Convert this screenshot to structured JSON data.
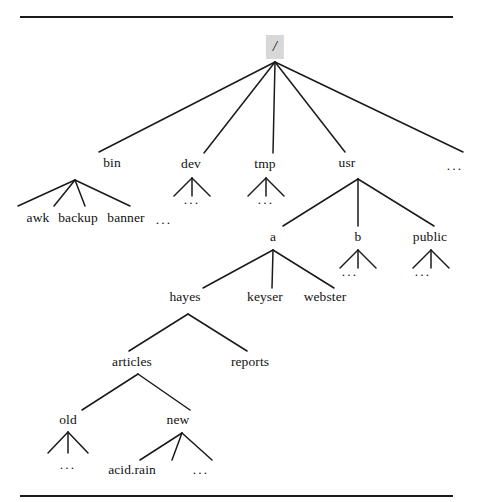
{
  "figure": {
    "kind": "unix-filesystem-tree-diagram",
    "top_rule": {
      "x1": 20,
      "y": 16,
      "x2": 453
    },
    "bottom_rule": {
      "x1": 20,
      "y": 495,
      "x2": 453
    },
    "line_color": "#1a1a1a",
    "text_color": "#111111",
    "root_highlight_color": "#d8d8d8",
    "background_color": "#ffffff"
  },
  "nodes": [
    {
      "id": "root",
      "label": "/",
      "x": 275,
      "y": 47,
      "kind": "root"
    },
    {
      "id": "bin",
      "label": "bin",
      "x": 112,
      "y": 163,
      "kind": "dir"
    },
    {
      "id": "dev",
      "label": "dev",
      "x": 191,
      "y": 164,
      "kind": "dir"
    },
    {
      "id": "tmp",
      "label": "tmp",
      "x": 265,
      "y": 164,
      "kind": "dir"
    },
    {
      "id": "usr",
      "label": "usr",
      "x": 347,
      "y": 163,
      "kind": "dir"
    },
    {
      "id": "root_more",
      "label": "...",
      "x": 455,
      "y": 166,
      "kind": "ellipsis"
    },
    {
      "id": "awk",
      "label": "awk",
      "x": 38,
      "y": 218,
      "kind": "file"
    },
    {
      "id": "backup",
      "label": "backup",
      "x": 78,
      "y": 218,
      "kind": "file"
    },
    {
      "id": "banner",
      "label": "banner",
      "x": 126,
      "y": 218,
      "kind": "file"
    },
    {
      "id": "bin_more",
      "label": "...",
      "x": 164,
      "y": 220,
      "kind": "ellipsis"
    },
    {
      "id": "dev_more",
      "label": "...",
      "x": 192,
      "y": 200,
      "kind": "ellipsis"
    },
    {
      "id": "tmp_more",
      "label": "...",
      "x": 266,
      "y": 200,
      "kind": "ellipsis"
    },
    {
      "id": "a",
      "label": "a",
      "x": 273,
      "y": 237,
      "kind": "dir"
    },
    {
      "id": "b",
      "label": "b",
      "x": 358,
      "y": 237,
      "kind": "dir"
    },
    {
      "id": "public",
      "label": "public",
      "x": 430,
      "y": 237,
      "kind": "dir"
    },
    {
      "id": "b_more",
      "label": "...",
      "x": 350,
      "y": 272,
      "kind": "ellipsis"
    },
    {
      "id": "pub_more",
      "label": "...",
      "x": 423,
      "y": 272,
      "kind": "ellipsis"
    },
    {
      "id": "hayes",
      "label": "hayes",
      "x": 185,
      "y": 297,
      "kind": "dir"
    },
    {
      "id": "keyser",
      "label": "keyser",
      "x": 265,
      "y": 297,
      "kind": "dir"
    },
    {
      "id": "webster",
      "label": "webster",
      "x": 325,
      "y": 297,
      "kind": "dir"
    },
    {
      "id": "articles",
      "label": "articles",
      "x": 132,
      "y": 362,
      "kind": "dir"
    },
    {
      "id": "reports",
      "label": "reports",
      "x": 250,
      "y": 362,
      "kind": "dir"
    },
    {
      "id": "old",
      "label": "old",
      "x": 68,
      "y": 420,
      "kind": "dir"
    },
    {
      "id": "new",
      "label": "new",
      "x": 178,
      "y": 420,
      "kind": "dir"
    },
    {
      "id": "old_more",
      "label": "...",
      "x": 68,
      "y": 465,
      "kind": "ellipsis"
    },
    {
      "id": "acidrain",
      "label": "acid.rain",
      "x": 132,
      "y": 470,
      "kind": "file"
    },
    {
      "id": "new_more",
      "label": "...",
      "x": 201,
      "y": 470,
      "kind": "ellipsis"
    }
  ],
  "edges": [
    {
      "from": "root",
      "to": "bin",
      "x1": 275,
      "y1": 62,
      "x2": 99,
      "y2": 152
    },
    {
      "from": "root",
      "to": "dev",
      "x1": 275,
      "y1": 62,
      "x2": 204,
      "y2": 153
    },
    {
      "from": "root",
      "to": "tmp",
      "x1": 275,
      "y1": 62,
      "x2": 273,
      "y2": 153
    },
    {
      "from": "root",
      "to": "usr",
      "x1": 275,
      "y1": 62,
      "x2": 345,
      "y2": 152
    },
    {
      "from": "root",
      "to": "root_more",
      "x1": 275,
      "y1": 62,
      "x2": 463,
      "y2": 152
    },
    {
      "from": "bin",
      "to": "awk",
      "x1": 75,
      "y1": 180,
      "x2": 18,
      "y2": 206
    },
    {
      "from": "bin",
      "to": "backup",
      "x1": 75,
      "y1": 180,
      "x2": 54,
      "y2": 206
    },
    {
      "from": "bin",
      "to": "banner",
      "x1": 75,
      "y1": 180,
      "x2": 85,
      "y2": 206
    },
    {
      "from": "bin",
      "to": "bin_more",
      "x1": 75,
      "y1": 180,
      "x2": 130,
      "y2": 206
    },
    {
      "from": "dev",
      "to": "dev_c1",
      "x1": 192,
      "y1": 178,
      "x2": 174,
      "y2": 196
    },
    {
      "from": "dev",
      "to": "dev_c2",
      "x1": 192,
      "y1": 178,
      "x2": 192,
      "y2": 196
    },
    {
      "from": "dev",
      "to": "dev_c3",
      "x1": 192,
      "y1": 178,
      "x2": 210,
      "y2": 196
    },
    {
      "from": "tmp",
      "to": "tmp_c1",
      "x1": 266,
      "y1": 178,
      "x2": 248,
      "y2": 196
    },
    {
      "from": "tmp",
      "to": "tmp_c2",
      "x1": 266,
      "y1": 178,
      "x2": 266,
      "y2": 196
    },
    {
      "from": "tmp",
      "to": "tmp_c3",
      "x1": 266,
      "y1": 178,
      "x2": 284,
      "y2": 196
    },
    {
      "from": "usr",
      "to": "a",
      "x1": 358,
      "y1": 179,
      "x2": 283,
      "y2": 226
    },
    {
      "from": "usr",
      "to": "b",
      "x1": 358,
      "y1": 179,
      "x2": 358,
      "y2": 226
    },
    {
      "from": "usr",
      "to": "public",
      "x1": 358,
      "y1": 179,
      "x2": 434,
      "y2": 226
    },
    {
      "from": "b",
      "to": "b_c1",
      "x1": 358,
      "y1": 250,
      "x2": 340,
      "y2": 268
    },
    {
      "from": "b",
      "to": "b_c2",
      "x1": 358,
      "y1": 250,
      "x2": 358,
      "y2": 268
    },
    {
      "from": "b",
      "to": "b_c3",
      "x1": 358,
      "y1": 250,
      "x2": 376,
      "y2": 268
    },
    {
      "from": "public",
      "to": "p_c1",
      "x1": 431,
      "y1": 250,
      "x2": 413,
      "y2": 268
    },
    {
      "from": "public",
      "to": "p_c2",
      "x1": 431,
      "y1": 250,
      "x2": 431,
      "y2": 268
    },
    {
      "from": "public",
      "to": "p_c3",
      "x1": 431,
      "y1": 250,
      "x2": 449,
      "y2": 268
    },
    {
      "from": "a",
      "to": "hayes",
      "x1": 273,
      "y1": 250,
      "x2": 203,
      "y2": 288
    },
    {
      "from": "a",
      "to": "keyser",
      "x1": 273,
      "y1": 250,
      "x2": 272,
      "y2": 288
    },
    {
      "from": "a",
      "to": "webster",
      "x1": 273,
      "y1": 250,
      "x2": 334,
      "y2": 288
    },
    {
      "from": "hayes",
      "to": "articles",
      "x1": 188,
      "y1": 314,
      "x2": 129,
      "y2": 351
    },
    {
      "from": "hayes",
      "to": "reports",
      "x1": 188,
      "y1": 314,
      "x2": 247,
      "y2": 351
    },
    {
      "from": "articles",
      "to": "old",
      "x1": 138,
      "y1": 374,
      "x2": 82,
      "y2": 410
    },
    {
      "from": "articles",
      "to": "new",
      "x1": 138,
      "y1": 374,
      "x2": 190,
      "y2": 410
    },
    {
      "from": "old",
      "to": "old_c1",
      "x1": 68,
      "y1": 432,
      "x2": 48,
      "y2": 453
    },
    {
      "from": "old",
      "to": "old_c2",
      "x1": 68,
      "y1": 432,
      "x2": 68,
      "y2": 453
    },
    {
      "from": "old",
      "to": "old_c3",
      "x1": 68,
      "y1": 432,
      "x2": 88,
      "y2": 453
    },
    {
      "from": "new",
      "to": "acidrain",
      "x1": 182,
      "y1": 433,
      "x2": 140,
      "y2": 460
    },
    {
      "from": "new",
      "to": "new_c2",
      "x1": 182,
      "y1": 433,
      "x2": 172,
      "y2": 460
    },
    {
      "from": "new",
      "to": "new_c3",
      "x1": 182,
      "y1": 433,
      "x2": 212,
      "y2": 460
    }
  ]
}
